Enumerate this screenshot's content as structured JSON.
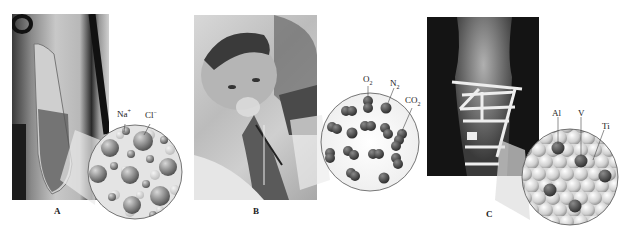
{
  "figure": {
    "panels": [
      {
        "id": "A",
        "label": "A",
        "photo_subject": "IV saline bag",
        "magnified_view": "ionic solution",
        "particles": [
          {
            "label": "Na",
            "charge": "+"
          },
          {
            "label": "Cl",
            "charge": "−"
          }
        ]
      },
      {
        "id": "B",
        "label": "B",
        "photo_subject": "child breathing through oxygen mask",
        "magnified_view": "gas mixture",
        "particles": [
          {
            "label": "O",
            "sub": "2"
          },
          {
            "label": "N",
            "sub": "2"
          },
          {
            "label": "CO",
            "sub": "2"
          }
        ]
      },
      {
        "id": "C",
        "label": "C",
        "photo_subject": "X-ray of bone with metal plate and screws",
        "magnified_view": "metal alloy lattice",
        "particles": [
          {
            "label": "Al"
          },
          {
            "label": "V"
          },
          {
            "label": "Ti"
          }
        ]
      }
    ]
  }
}
